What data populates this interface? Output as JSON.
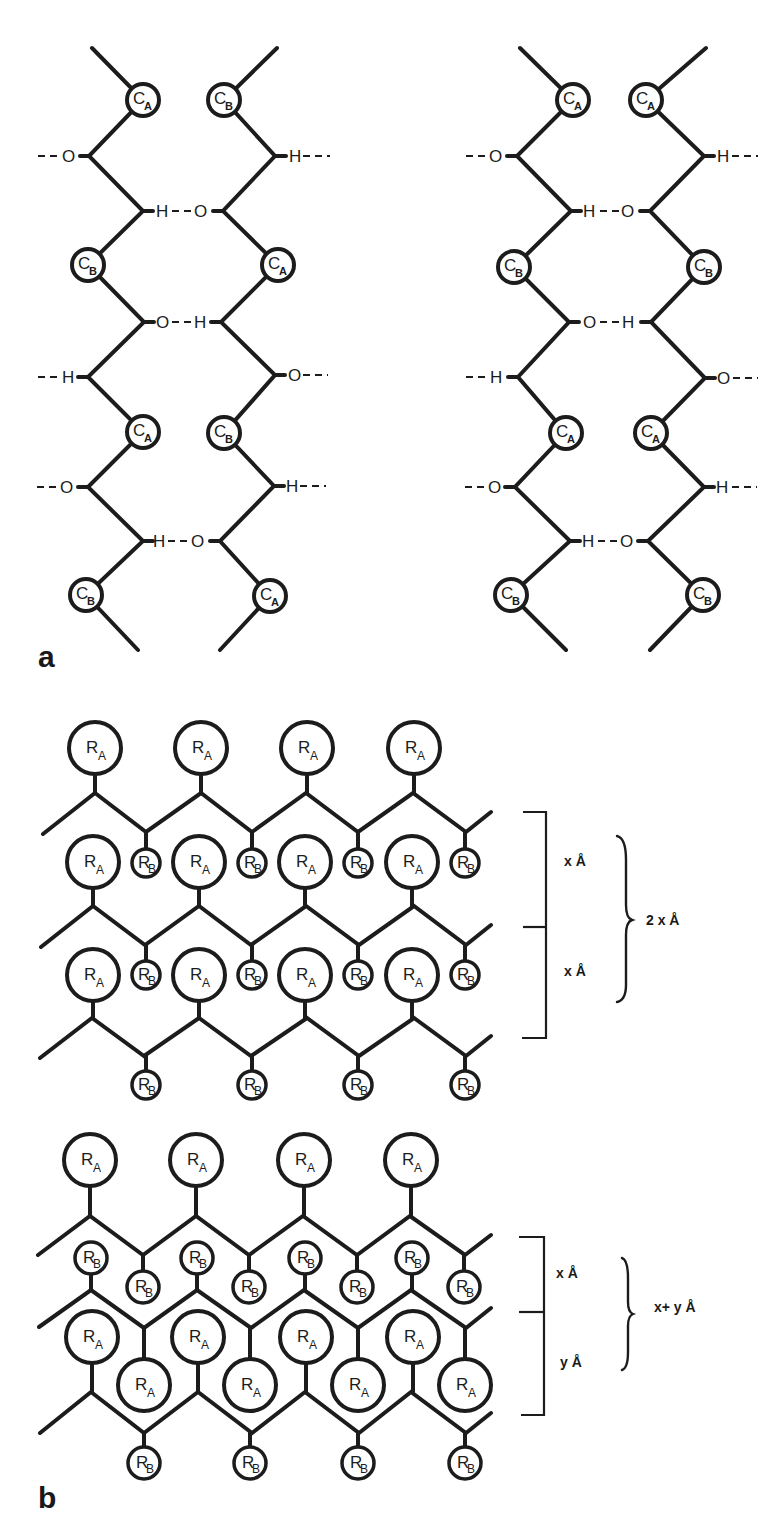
{
  "panels": {
    "a": {
      "label": "a",
      "chains": [
        {
          "name": "left-sheet",
          "offset_x": 0,
          "residues": [
            {
              "x": 143,
              "y": 100,
              "sym": "C",
              "sub": "A"
            },
            {
              "x": 224,
              "y": 100,
              "sym": "C",
              "sub": "B"
            },
            {
              "x": 88,
              "y": 265,
              "sym": "C",
              "sub": "B"
            },
            {
              "x": 278,
              "y": 265,
              "sym": "C",
              "sub": "A"
            },
            {
              "x": 143,
              "y": 432,
              "sym": "C",
              "sub": "A"
            },
            {
              "x": 224,
              "y": 433,
              "sym": "C",
              "sub": "B"
            },
            {
              "x": 86,
              "y": 595,
              "sym": "C",
              "sub": "B"
            },
            {
              "x": 270,
              "y": 596,
              "sym": "C",
              "sub": "A"
            }
          ]
        },
        {
          "name": "right-sheet",
          "offset_x": 0,
          "residues": [
            {
              "x": 573,
              "y": 100,
              "sym": "C",
              "sub": "A"
            },
            {
              "x": 646,
              "y": 100,
              "sym": "C",
              "sub": "A"
            },
            {
              "x": 514,
              "y": 267,
              "sym": "C",
              "sub": "B"
            },
            {
              "x": 704,
              "y": 267,
              "sym": "C",
              "sub": "B"
            },
            {
              "x": 566,
              "y": 433,
              "sym": "C",
              "sub": "A"
            },
            {
              "x": 651,
              "y": 433,
              "sym": "C",
              "sub": "A"
            },
            {
              "x": 511,
              "y": 595,
              "sym": "C",
              "sub": "B"
            },
            {
              "x": 703,
              "y": 595,
              "sym": "C",
              "sub": "B"
            }
          ]
        }
      ],
      "atoms": {
        "O": "O",
        "H": "H"
      }
    },
    "b": {
      "label": "b",
      "residue_large": {
        "sym": "R",
        "sub": "A"
      },
      "residue_small": {
        "sym": "R",
        "sub": "B"
      },
      "lattice_1": {
        "dimensions": {
          "upper": "x Å",
          "lower": "x Å",
          "total": "2 x Å"
        }
      },
      "lattice_2": {
        "dimensions": {
          "upper": "x Å",
          "lower": "y Å",
          "total": "x+ y Å"
        }
      }
    }
  }
}
